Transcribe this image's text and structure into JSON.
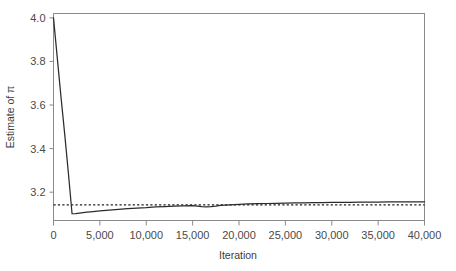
{
  "chart_data": {
    "type": "line",
    "title": "",
    "xlabel": "Iteration",
    "ylabel": "Estimate of π",
    "xlim": [
      0,
      40000
    ],
    "ylim": [
      3.07,
      4.02
    ],
    "grid": false,
    "legend": "none",
    "xticks": [
      0,
      5000,
      10000,
      15000,
      20000,
      25000,
      30000,
      35000,
      40000
    ],
    "xticklabels": [
      "0",
      "5,000",
      "10,000",
      "15,000",
      "20,000",
      "25,000",
      "30,000",
      "35,000",
      "40,000"
    ],
    "yticks": [
      3.2,
      3.4,
      3.6,
      3.8,
      4.0
    ],
    "yticklabels": [
      "3.2",
      "3.4",
      "3.6",
      "3.8",
      "4.0"
    ],
    "series": [
      {
        "name": "Estimate of pi",
        "style": "solid",
        "color": "#2b2b2b",
        "x": [
          0,
          400,
          800,
          1200,
          1600,
          2000,
          2400,
          2800,
          3200,
          3600,
          4000,
          5000,
          6000,
          7000,
          8000,
          9000,
          10000,
          11000,
          12000,
          13000,
          14000,
          15000,
          15500,
          16000,
          16500,
          17000,
          17500,
          18000,
          19000,
          20000,
          21000,
          22000,
          23000,
          24000,
          25000,
          26000,
          27000,
          28000,
          29000,
          30000,
          31000,
          32000,
          33000,
          34000,
          35000,
          36000,
          37000,
          38000,
          39000,
          40000
        ],
        "y": [
          4.0,
          3.82,
          3.64,
          3.47,
          3.29,
          3.101,
          3.102,
          3.104,
          3.106,
          3.108,
          3.11,
          3.114,
          3.118,
          3.121,
          3.124,
          3.127,
          3.129,
          3.132,
          3.134,
          3.136,
          3.137,
          3.138,
          3.136,
          3.134,
          3.133,
          3.134,
          3.136,
          3.139,
          3.142,
          3.144,
          3.146,
          3.147,
          3.148,
          3.149,
          3.15,
          3.151,
          3.151,
          3.152,
          3.152,
          3.153,
          3.153,
          3.153,
          3.154,
          3.154,
          3.154,
          3.155,
          3.155,
          3.155,
          3.156,
          3.156
        ]
      },
      {
        "name": "pi reference",
        "style": "dotted",
        "color": "#1f1f1f",
        "value": 3.1416
      }
    ],
    "annotations": []
  },
  "axes": {
    "x_title": "Iteration",
    "y_title": "Estimate of π"
  },
  "colors": {
    "background": "#ffffff",
    "frame": "#8a8a8a",
    "curve": "#2b2b2b",
    "reference": "#1f1f1f",
    "text": "#4a4a4a"
  }
}
